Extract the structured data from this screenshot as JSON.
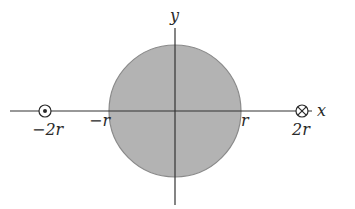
{
  "diagram": {
    "colors": {
      "background": "#ffffff",
      "disk_fill": "#b3b3b3",
      "disk_stroke": "#8a8a8a",
      "axis": "#333333",
      "text": "#2a2a2a"
    },
    "axes": {
      "x_label": "x",
      "y_label": "y"
    },
    "disk": {
      "label": "cylinder cross-section",
      "radius_label": "r"
    },
    "tick_labels": {
      "neg_2r": "−2r",
      "neg_r": "−r",
      "pos_r": "r",
      "pos_2r": "2r"
    },
    "wires": [
      {
        "position": "−2r",
        "symbol": "dot-in-circle",
        "direction": "out of page"
      },
      {
        "position": "2r",
        "symbol": "cross-in-circle",
        "direction": "into page"
      }
    ]
  }
}
